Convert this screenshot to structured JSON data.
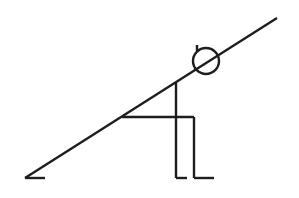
{
  "diagram": {
    "stroke_color": "#1e1e1e",
    "background_color": "#ffffff",
    "incline": {
      "x1": 25,
      "y1": 178,
      "x2": 277,
      "y2": 18
    },
    "ground_tick": {
      "x1": 25,
      "y1": 178,
      "x2": 45,
      "y2": 178
    },
    "head": {
      "cx": 206,
      "cy": 61,
      "r": 13
    },
    "head_tick": {
      "x1": 197,
      "y1": 45,
      "x2": 197,
      "y2": 51
    },
    "torso": {
      "x1": 176,
      "y1": 82,
      "x2": 176,
      "y2": 178
    },
    "front_foot": {
      "x1": 176,
      "y1": 178,
      "x2": 187,
      "y2": 178
    },
    "thigh": {
      "x1": 122,
      "y1": 117,
      "x2": 194,
      "y2": 117
    },
    "shin": {
      "x1": 194,
      "y1": 117,
      "x2": 194,
      "y2": 178
    },
    "back_foot": {
      "x1": 194,
      "y1": 178,
      "x2": 214,
      "y2": 178
    }
  }
}
